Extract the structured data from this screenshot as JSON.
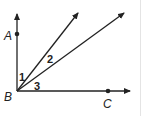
{
  "diagram": {
    "type": "geometry-angles",
    "vertex": {
      "label": "B"
    },
    "points": [
      {
        "label": "A"
      },
      {
        "label": "C"
      }
    ],
    "angle_labels": [
      "1",
      "2",
      "3"
    ],
    "stroke_color": "#222222"
  }
}
